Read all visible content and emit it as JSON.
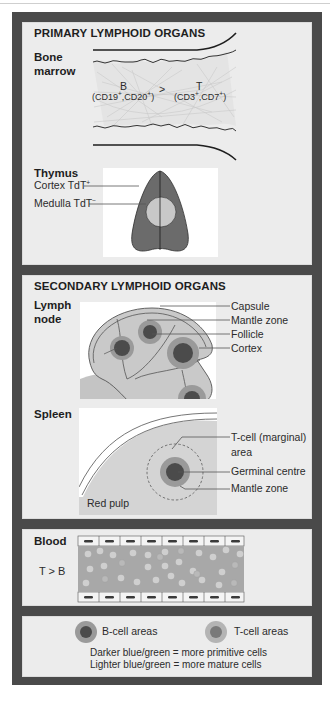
{
  "figure": {
    "primary": {
      "title": "PRIMARY LYMPHOID ORGANS",
      "bone_marrow": {
        "label_line1": "Bone",
        "label_line2": "marrow",
        "b_letter": "B",
        "b_markers_prefix": "(CD19",
        "b_markers_mid": ",CD20",
        "b_markers_suffix": ")",
        "comparator": ">",
        "t_letter": "T",
        "t_markers_prefix": "(CD3",
        "t_markers_mid": ",CD7",
        "t_markers_suffix": ")",
        "sup_plus": "+"
      },
      "thymus": {
        "label": "Thymus",
        "cortex_label": "Cortex TdT",
        "cortex_sup": "+",
        "medulla_label": "Medulla TdT",
        "medulla_sup": "−"
      }
    },
    "secondary": {
      "title": "SECONDARY LYMPHOID ORGANS",
      "lymph_node": {
        "label_line1": "Lymph",
        "label_line2": "node",
        "callouts": [
          "Capsule",
          "Mantle zone",
          "Follicle",
          "Cortex"
        ]
      },
      "spleen": {
        "label": "Spleen",
        "callout_tcell_line1": "T-cell (marginal)",
        "callout_tcell_line2": "area",
        "callout_germinal": "Germinal centre",
        "callout_mantle": "Mantle zone",
        "red_pulp": "Red pulp"
      }
    },
    "blood": {
      "label": "Blood",
      "ratio": "T > B"
    },
    "legend": {
      "b_cell_label": "B-cell areas",
      "t_cell_label": "T-cell areas",
      "note_line1": "Darker blue/green = more primitive cells",
      "note_line2": "Lighter blue/green = more mature cells"
    },
    "colors": {
      "frame": "#4a4a4a",
      "panel": "#ececec",
      "dark_core": "#4b4b4b",
      "mantle": "#9a9a9a",
      "tissue": "#c4c4c4",
      "medulla": "#c8c8c8",
      "cortex": "#6b6b6b"
    }
  }
}
